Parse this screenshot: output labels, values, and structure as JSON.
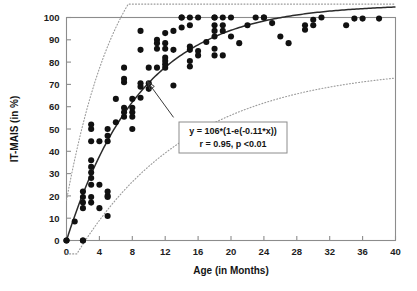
{
  "chart_data": {
    "type": "scatter",
    "title": "",
    "xlabel": "Age (in Months)",
    "ylabel": "IT-MAIS (in %)",
    "xlim": [
      0,
      40
    ],
    "ylim": [
      0,
      100
    ],
    "xticks": [
      0,
      4,
      8,
      12,
      16,
      20,
      24,
      28,
      32,
      36,
      40
    ],
    "yticks": [
      0,
      10,
      20,
      30,
      40,
      50,
      60,
      70,
      80,
      90,
      100
    ],
    "grid": false,
    "legend": null,
    "annotations": [
      {
        "name": "fit-equation-box",
        "lines": [
          "y = 106*(1-e(-0.11*x))",
          "r = 0.95, p <0.01"
        ],
        "x_data": 13.5,
        "y_data": 57,
        "arrow_to": {
          "x_data": 9.8,
          "y_data": 71.5
        }
      }
    ],
    "fit_curve": {
      "name": "exponential-fit",
      "equation": "y = 106*(1-e(-0.11*x))",
      "amplitude": 106,
      "rate": 0.11,
      "r": 0.95,
      "p": "<0.01",
      "style": "solid",
      "color": "#2b2b2b"
    },
    "confidence_bands": [
      {
        "name": "upper-confidence-band",
        "amplitude": 128,
        "rate": 0.155,
        "offset": 18,
        "style": "dotted",
        "color": "#9a9a9a"
      },
      {
        "name": "lower-confidence-band",
        "amplitude": 92,
        "rate": 0.072,
        "offset": -14,
        "style": "dotted",
        "color": "#9a9a9a"
      }
    ],
    "series": [
      {
        "name": "IT-MAIS scores",
        "marker": "filled-circle",
        "color": "#111111",
        "points": [
          [
            0,
            0
          ],
          [
            0,
            0
          ],
          [
            1,
            8.5
          ],
          [
            2,
            0
          ],
          [
            2,
            0
          ],
          [
            2,
            14.5
          ],
          [
            2,
            17
          ],
          [
            2,
            19.5
          ],
          [
            2,
            22
          ],
          [
            3,
            19.5
          ],
          [
            3,
            17
          ],
          [
            3,
            25
          ],
          [
            3,
            28
          ],
          [
            3,
            30.5
          ],
          [
            3,
            33
          ],
          [
            3,
            36
          ],
          [
            3,
            44.5
          ],
          [
            3,
            50
          ],
          [
            3,
            52
          ],
          [
            4,
            44.5
          ],
          [
            4,
            25
          ],
          [
            4,
            14.5
          ],
          [
            5,
            11
          ],
          [
            5,
            20
          ],
          [
            5,
            22
          ],
          [
            5,
            44.5
          ],
          [
            5,
            47
          ],
          [
            5,
            50
          ],
          [
            5,
            19.5
          ],
          [
            6,
            53
          ],
          [
            6,
            63.5
          ],
          [
            7,
            55.5
          ],
          [
            7,
            57.5
          ],
          [
            7,
            59.5
          ],
          [
            7,
            71
          ],
          [
            7,
            72.5
          ],
          [
            7,
            77.5
          ],
          [
            8,
            55.5
          ],
          [
            8,
            57.5
          ],
          [
            8,
            59.5
          ],
          [
            8,
            50
          ],
          [
            8,
            63.5
          ],
          [
            9,
            64
          ],
          [
            9,
            69
          ],
          [
            9,
            70.5
          ],
          [
            9,
            85.5
          ],
          [
            9,
            94
          ],
          [
            10,
            68
          ],
          [
            10,
            70.5
          ],
          [
            10,
            77.5
          ],
          [
            11,
            77.5
          ],
          [
            11,
            86
          ],
          [
            11,
            88.5
          ],
          [
            11,
            90
          ],
          [
            12,
            77.5
          ],
          [
            12,
            79
          ],
          [
            12,
            80.5
          ],
          [
            12,
            82
          ],
          [
            12,
            86
          ],
          [
            12,
            88.5
          ],
          [
            12,
            93
          ],
          [
            13,
            94
          ],
          [
            13,
            85.5
          ],
          [
            13,
            69.5
          ],
          [
            14,
            100
          ],
          [
            14,
            100
          ],
          [
            14,
            95.5
          ],
          [
            15,
            78
          ],
          [
            15,
            80.5
          ],
          [
            15,
            85.5
          ],
          [
            15,
            87
          ],
          [
            15,
            100
          ],
          [
            15,
            96.5
          ],
          [
            16,
            83
          ],
          [
            16,
            85
          ],
          [
            16,
            100
          ],
          [
            17,
            89
          ],
          [
            18,
            100
          ],
          [
            18,
            100
          ],
          [
            18,
            96.5
          ],
          [
            18,
            94
          ],
          [
            18,
            91.5
          ],
          [
            18,
            83
          ],
          [
            18,
            86
          ],
          [
            19,
            100
          ],
          [
            19,
            96.5
          ],
          [
            19,
            94
          ],
          [
            19,
            83
          ],
          [
            20,
            100
          ],
          [
            20,
            91.5
          ],
          [
            21,
            88.5
          ],
          [
            22,
            96.5
          ],
          [
            23,
            100
          ],
          [
            24,
            100
          ],
          [
            24,
            100
          ],
          [
            25,
            97.5
          ],
          [
            26,
            91.5
          ],
          [
            27,
            88.5
          ],
          [
            29,
            96.5
          ],
          [
            29,
            94.5
          ],
          [
            30,
            99
          ],
          [
            30,
            96.5
          ],
          [
            31,
            100
          ],
          [
            34,
            96.5
          ],
          [
            35,
            99.5
          ],
          [
            36,
            99.5
          ],
          [
            38,
            99.5
          ]
        ]
      }
    ]
  },
  "axes": {
    "x_tick_labels": [
      "0",
      "4",
      "8",
      "12",
      "16",
      "20",
      "24",
      "28",
      "32",
      "36",
      "40"
    ],
    "y_tick_labels": [
      "0",
      "10",
      "20",
      "30",
      "40",
      "50",
      "60",
      "70",
      "80",
      "90",
      "100"
    ],
    "x_title": "Age (in Months)",
    "y_title": "IT-MAIS (in %)"
  },
  "annotation_box": {
    "line1": "y = 106*(1-e(-0.11*x))",
    "line2": "r = 0.95, p <0.01"
  },
  "colors": {
    "background": "#ffffff",
    "marker": "#111111",
    "fit_line": "#2b2b2b",
    "band_line": "#9a9a9a",
    "frame": "#8c8c8c",
    "text": "#141414"
  }
}
